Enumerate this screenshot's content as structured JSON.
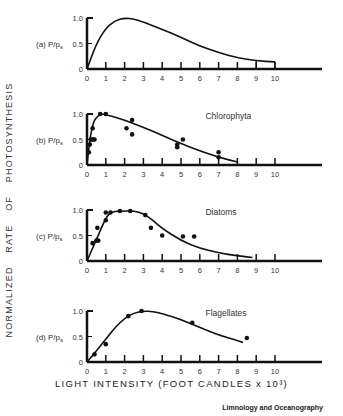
{
  "figure": {
    "y_axis_label": "NORMALIZED   RATE   OF   PHOTOSYNTHESIS",
    "x_axis_label": "LIGHT INTENSITY (FOOT CANDLES x 10³)",
    "credit": "Limnology and Oceanography",
    "line_color": "#111111",
    "point_color": "#111111"
  },
  "chart_data": [
    {
      "type": "line",
      "panel": "(a)",
      "ylabel": "P/Ps",
      "title": "",
      "x_ticks": [
        0,
        1,
        2,
        3,
        4,
        5,
        6,
        7,
        8,
        9,
        10
      ],
      "y_ticks": [
        0,
        0.5,
        1.0
      ],
      "xlim": [
        0,
        10
      ],
      "ylim": [
        0,
        1.0
      ],
      "curve": {
        "x": [
          0,
          0.5,
          1,
          1.5,
          2,
          2.5,
          3,
          4,
          5,
          6,
          7,
          8,
          9,
          10
        ],
        "y": [
          0,
          0.5,
          0.8,
          0.95,
          1.0,
          0.98,
          0.92,
          0.78,
          0.62,
          0.45,
          0.32,
          0.22,
          0.16,
          0.14
        ]
      },
      "points": []
    },
    {
      "type": "scatter",
      "panel": "(b)",
      "ylabel": "P/Ps",
      "title": "Chlorophyta",
      "x_ticks": [
        0,
        1,
        2,
        3,
        4,
        5,
        6,
        7,
        8,
        9,
        10
      ],
      "y_ticks": [
        0,
        0.5,
        1.0
      ],
      "xlim": [
        0,
        10
      ],
      "ylim": [
        0,
        1.0
      ],
      "curve": {
        "x": [
          0,
          0.1,
          0.2,
          0.3,
          0.4,
          0.6,
          0.8,
          1,
          2,
          3,
          4,
          5,
          6,
          7,
          8
        ],
        "y": [
          0,
          0.35,
          0.6,
          0.78,
          0.88,
          0.97,
          1.0,
          0.99,
          0.88,
          0.74,
          0.58,
          0.42,
          0.28,
          0.15,
          0.06
        ]
      },
      "points": {
        "x": [
          0.1,
          0.15,
          0.2,
          0.25,
          0.3,
          0.35,
          0.4,
          0.7,
          1.0,
          2.1,
          2.4,
          2.4,
          4.8,
          4.8,
          5.1,
          7.0,
          7.0
        ],
        "y": [
          0.25,
          0.4,
          0.5,
          0.5,
          0.72,
          0.5,
          0.5,
          1.0,
          1.0,
          0.72,
          0.88,
          0.6,
          0.4,
          0.35,
          0.5,
          0.25,
          0.15
        ]
      }
    },
    {
      "type": "scatter",
      "panel": "(c)",
      "ylabel": "P/Ps",
      "title": "Diatoms",
      "x_ticks": [
        0,
        1,
        2,
        3,
        4,
        5,
        6,
        7,
        8,
        9,
        10
      ],
      "y_ticks": [
        0,
        0.5,
        1.0
      ],
      "xlim": [
        0,
        10
      ],
      "ylim": [
        0,
        1.0
      ],
      "curve": {
        "x": [
          0,
          0.5,
          1,
          1.3,
          2,
          2.5,
          3,
          3.5,
          4,
          5,
          6,
          7,
          8,
          8.8
        ],
        "y": [
          0,
          0.42,
          0.85,
          0.97,
          0.98,
          0.98,
          0.93,
          0.8,
          0.64,
          0.4,
          0.25,
          0.16,
          0.1,
          0.07
        ]
      },
      "points": {
        "x": [
          0.3,
          0.5,
          0.55,
          0.6,
          1.0,
          1.0,
          1.25,
          1.75,
          2.3,
          3.1,
          3.4,
          4.0,
          5.1,
          5.7
        ],
        "y": [
          0.35,
          0.4,
          0.65,
          0.4,
          0.8,
          0.95,
          0.95,
          0.98,
          0.98,
          0.9,
          0.65,
          0.5,
          0.48,
          0.48
        ]
      }
    },
    {
      "type": "scatter",
      "panel": "(d)",
      "ylabel": "P/Ps",
      "title": "Flagellates",
      "x_ticks": [
        0,
        1,
        2,
        3,
        4,
        5,
        6,
        7,
        8,
        9,
        10
      ],
      "y_ticks": [
        0,
        0.5,
        1.0
      ],
      "xlim": [
        0,
        10
      ],
      "ylim": [
        0,
        1.0
      ],
      "curve": {
        "x": [
          0,
          0.5,
          1,
          1.5,
          2,
          2.5,
          3,
          3.5,
          4,
          5,
          6,
          7,
          8,
          8.3
        ],
        "y": [
          0,
          0.22,
          0.45,
          0.68,
          0.86,
          0.96,
          1.0,
          0.99,
          0.95,
          0.83,
          0.68,
          0.53,
          0.42,
          0.38
        ]
      },
      "points": {
        "x": [
          0.4,
          1.0,
          2.2,
          2.9,
          5.6,
          8.5
        ],
        "y": [
          0.15,
          0.35,
          0.9,
          1.0,
          0.77,
          0.47
        ]
      }
    }
  ]
}
